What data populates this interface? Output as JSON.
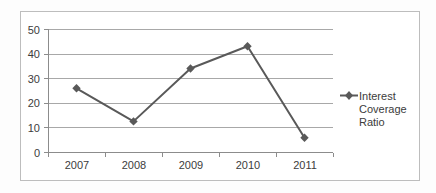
{
  "chart_data": {
    "type": "line",
    "title": "",
    "subtitle": "",
    "xlabel": "",
    "ylabel": "",
    "categories": [
      "2007",
      "2008",
      "2009",
      "2010",
      "2011"
    ],
    "series": [
      {
        "name": "Interest Coverage Ratio",
        "values": [
          26,
          12.6,
          34,
          43,
          6
        ],
        "color": "#595959",
        "marker": "diamond"
      }
    ],
    "ylim": [
      0,
      50
    ],
    "ytick_values": [
      0,
      10,
      20,
      30,
      40,
      50
    ],
    "ytick_labels": [
      "0",
      "10",
      "20",
      "30",
      "40",
      "50"
    ],
    "grid": "horizontal",
    "legend_position": "right",
    "legend_entries": [
      {
        "label": "Interest Coverage Ratio",
        "lines": [
          "Interest",
          "Coverage",
          "Ratio"
        ],
        "color": "#595959",
        "marker": "diamond"
      }
    ]
  },
  "axis": {
    "y_labels": {
      "t50": "50",
      "t40": "40",
      "t30": "30",
      "t20": "20",
      "t10": "10",
      "t0": "0"
    },
    "x_labels": {
      "c0": "2007",
      "c1": "2008",
      "c2": "2009",
      "c3": "2010",
      "c4": "2011"
    }
  },
  "legend": {
    "line1": "Interest",
    "line2": "Coverage",
    "line3": "Ratio"
  },
  "colors": {
    "series": "#595959",
    "gridline": "#a8a8a8",
    "axis": "#8c8c8c",
    "frame": "#bdbdbd",
    "text": "#3c3c3c",
    "background": "#ffffff"
  }
}
